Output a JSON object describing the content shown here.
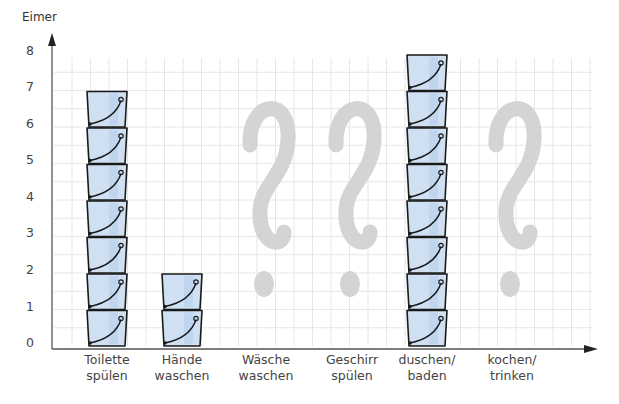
{
  "chart_data": {
    "type": "bar",
    "title": "",
    "xlabel": "",
    "ylabel": "Eimer",
    "ylim": [
      0,
      8
    ],
    "yticks": [
      "0",
      "1",
      "2",
      "3",
      "4",
      "5",
      "6",
      "7",
      "8"
    ],
    "grid": true,
    "categories": [
      "Toilette spülen",
      "Hände waschen",
      "Wäsche waschen",
      "Geschirr spülen",
      "duschen/ baden",
      "kochen/ trinken"
    ],
    "category_lines": [
      [
        "Toilette",
        "spülen"
      ],
      [
        "Hände",
        "waschen"
      ],
      [
        "Wäsche",
        "waschen"
      ],
      [
        "Geschirr",
        "spülen"
      ],
      [
        "duschen/",
        "baden"
      ],
      [
        "kochen/",
        "trinken"
      ]
    ],
    "values": [
      7,
      2,
      null,
      null,
      8,
      null
    ],
    "unknown_marker": "?",
    "unit_icon": "bucket-icon",
    "colors": {
      "bucket_fill": "#cfe0f2",
      "bucket_stroke": "#1a1a1a",
      "question_mark": "#d4d4d4",
      "grid": "#e6e6e6",
      "axis": "#555555"
    }
  }
}
